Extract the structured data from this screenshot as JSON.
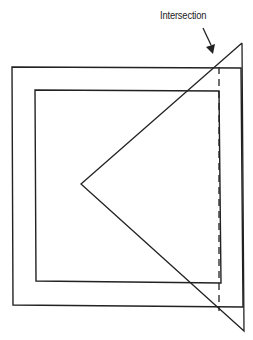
{
  "diagram": {
    "annotation": {
      "label": "Intersection"
    },
    "colors": {
      "stroke": "#222222",
      "background": "#ffffff"
    },
    "shapes": {
      "outer_rect": {
        "x1": 12,
        "y1": 67,
        "x2": 241,
        "y2": 307
      },
      "inner_rect": {
        "x1": 35,
        "y1": 90,
        "x2": 221,
        "y2": 283
      },
      "triangle": {
        "apex": [
          81,
          184
        ],
        "top": [
          242,
          43
        ],
        "bottom": [
          244,
          331
        ]
      },
      "dashed_line": {
        "x": 219,
        "y1": 67,
        "y2": 311
      }
    }
  }
}
